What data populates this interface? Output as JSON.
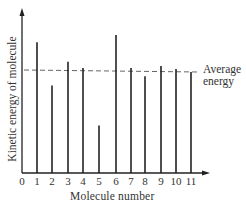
{
  "chart_data": {
    "type": "bar",
    "title": "",
    "xlabel": "Molecule number",
    "ylabel": "Kinetic energy of molecule",
    "categories": [
      "1",
      "2",
      "3",
      "4",
      "5",
      "6",
      "7",
      "8",
      "9",
      "10",
      "11"
    ],
    "values": [
      1.27,
      0.85,
      1.08,
      1.02,
      0.46,
      1.34,
      1.02,
      0.94,
      1.04,
      1.01,
      0.98
    ],
    "value_units": "relative to average energy (average = 1.0)",
    "x_ticks": [
      "0",
      "1",
      "2",
      "3",
      "4",
      "5",
      "6",
      "7",
      "8",
      "9",
      "10",
      "11"
    ],
    "y_ticks": [],
    "reference_line": {
      "label": "Average energy",
      "value": 1.0,
      "style": "dashed"
    },
    "annotations": [
      "Average energy"
    ],
    "grid": false,
    "legend": null,
    "bar_style": "thin vertical lines",
    "ylim": [
      0,
      1.6
    ]
  },
  "labels": {
    "xlabel": "Molecule number",
    "ylabel": "Kinetic energy of molecule",
    "avg_line1": "Average",
    "avg_line2": "energy"
  },
  "ticks": [
    "0",
    "1",
    "2",
    "3",
    "4",
    "5",
    "6",
    "7",
    "8",
    "9",
    "10",
    "11"
  ],
  "colors": {
    "line": "#222222",
    "dash": "#555555",
    "text": "#333333",
    "background": "#ffffff"
  }
}
